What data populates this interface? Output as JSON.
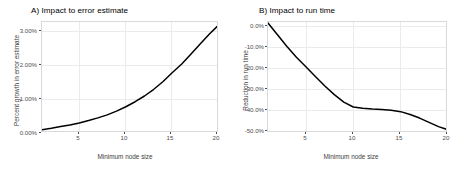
{
  "figure": {
    "background": "#ffffff",
    "line_color": "#000000",
    "grid_color": "#ebebeb",
    "panel_border_color": "#d9d9d9",
    "axis_text_color": "#4d4d4d"
  },
  "panels": [
    {
      "id": "panel-a",
      "title": "A) Impact to error estimate",
      "xlabel": "Minimum node size",
      "ylabel": "Percent growth in error estimate",
      "x_ticks": [
        "5",
        "10",
        "15",
        "20"
      ],
      "y_ticks": [
        "0.00%",
        "1.00%",
        "2.00%",
        "3.00%"
      ]
    },
    {
      "id": "panel-b",
      "title": "B) Impact to run time",
      "xlabel": "Minimum node size",
      "ylabel": "Reduction in run time",
      "x_ticks": [
        "5",
        "10",
        "15",
        "20"
      ],
      "y_ticks": [
        "-50.0%",
        "-40.0%",
        "-30.0%",
        "-20.0%",
        "-10.0%",
        "0.0%"
      ]
    }
  ],
  "chart_data": [
    {
      "type": "line",
      "title": "A) Impact to error estimate",
      "xlabel": "Minimum node size",
      "ylabel": "Percent growth in error estimate",
      "xlim": [
        1,
        20
      ],
      "ylim": [
        0.0,
        3.3
      ],
      "x_ticks": [
        5,
        10,
        15,
        20
      ],
      "y_ticks": [
        0.0,
        1.0,
        2.0,
        3.0
      ],
      "y_tick_labels": [
        "0.00%",
        "1.00%",
        "2.00%",
        "3.00%"
      ],
      "grid": true,
      "legend": "none",
      "series": [
        {
          "name": "Percent growth in error estimate",
          "color": "#000000",
          "x": [
            1,
            2,
            3,
            4,
            5,
            6,
            7,
            8,
            9,
            10,
            11,
            12,
            13,
            14,
            15,
            16,
            17,
            18,
            19,
            20
          ],
          "values": [
            0.1,
            0.14,
            0.19,
            0.24,
            0.3,
            0.37,
            0.45,
            0.54,
            0.65,
            0.78,
            0.93,
            1.1,
            1.3,
            1.53,
            1.8,
            2.05,
            2.35,
            2.65,
            2.95,
            3.22
          ]
        }
      ]
    },
    {
      "type": "line",
      "title": "B) Impact to run time",
      "xlabel": "Minimum node size",
      "ylabel": "Reduction in run time",
      "xlim": [
        1,
        20
      ],
      "ylim": [
        -50.0,
        2.0
      ],
      "x_ticks": [
        5,
        10,
        15,
        20
      ],
      "y_ticks": [
        -50.0,
        -40.0,
        -30.0,
        -20.0,
        -10.0,
        0.0
      ],
      "y_tick_labels": [
        "-50.0%",
        "-40.0%",
        "-30.0%",
        "-20.0%",
        "-10.0%",
        "0.0%"
      ],
      "grid": true,
      "legend": "none",
      "series": [
        {
          "name": "Reduction in run time",
          "color": "#000000",
          "x": [
            1,
            2,
            3,
            4,
            5,
            6,
            7,
            8,
            9,
            10,
            11,
            12,
            13,
            14,
            15,
            16,
            17,
            18,
            19,
            20
          ],
          "values": [
            1.5,
            -4.0,
            -9.5,
            -14.5,
            -19.0,
            -23.5,
            -28.0,
            -32.0,
            -35.5,
            -37.8,
            -38.4,
            -38.8,
            -39.0,
            -39.3,
            -40.0,
            -41.3,
            -43.0,
            -45.0,
            -47.0,
            -48.5
          ]
        }
      ]
    }
  ]
}
